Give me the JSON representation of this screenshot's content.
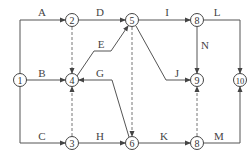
{
  "diagram": {
    "type": "activity-on-arrow network",
    "nodes": [
      {
        "id": "n1",
        "label": "1"
      },
      {
        "id": "n2",
        "label": "2"
      },
      {
        "id": "n3",
        "label": "3"
      },
      {
        "id": "n4",
        "label": "4"
      },
      {
        "id": "n5",
        "label": "5"
      },
      {
        "id": "n6",
        "label": "6"
      },
      {
        "id": "n8a",
        "label": "8"
      },
      {
        "id": "n9",
        "label": "9"
      },
      {
        "id": "n8b",
        "label": "8"
      },
      {
        "id": "n10",
        "label": "10"
      }
    ],
    "activities": [
      {
        "label": "A",
        "from": "1",
        "to": "2"
      },
      {
        "label": "B",
        "from": "1",
        "to": "4"
      },
      {
        "label": "C",
        "from": "1",
        "to": "3"
      },
      {
        "label": "D",
        "from": "2",
        "to": "5"
      },
      {
        "label": "E",
        "from": "4",
        "to": "5"
      },
      {
        "label": "G",
        "from": "6",
        "to": "4"
      },
      {
        "label": "H",
        "from": "3",
        "to": "6"
      },
      {
        "label": "I",
        "from": "5",
        "to": "8"
      },
      {
        "label": "J",
        "from": "5",
        "to": "9"
      },
      {
        "label": "K",
        "from": "6",
        "to": "8"
      },
      {
        "label": "L",
        "from": "8",
        "to": "10"
      },
      {
        "label": "M",
        "from": "8",
        "to": "10"
      },
      {
        "label": "N",
        "from": "8",
        "to": "9"
      }
    ],
    "dummies": [
      {
        "from": "2",
        "to": "4"
      },
      {
        "from": "3",
        "to": "4"
      },
      {
        "from": "5",
        "to": "6"
      },
      {
        "from": "8",
        "to": "9"
      }
    ]
  }
}
